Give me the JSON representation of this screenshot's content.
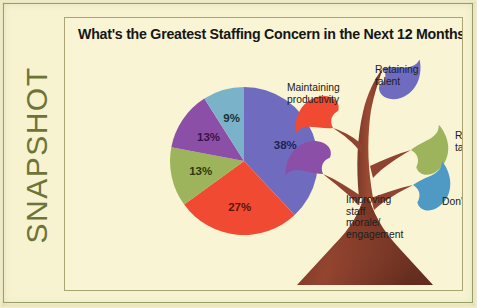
{
  "card": {
    "rail_label": "SNAPSHOT",
    "rail_color": "#6e7436",
    "background": "#f7f2cf",
    "panel_background": "#f9f4d4",
    "border_color": "#a8a572"
  },
  "panel": {
    "title": "What's the Greatest Staffing Concern in the Next 12 Months?"
  },
  "chart_data": {
    "type": "pie",
    "title": "What's the Greatest Staffing Concern in the Next 12 Months?",
    "xlabel": "",
    "ylabel": "",
    "grid": false,
    "legend_position": "external-tree-diagram",
    "start_angle_deg": 0,
    "direction": "clockwise",
    "categories": [
      "Retaining talent",
      "Maintaining productivity",
      "Recruiting talent",
      "Improving staff morale/engagement",
      "Don't know"
    ],
    "values": [
      38,
      27,
      13,
      13,
      9
    ],
    "data_labels": [
      "38%",
      "27%",
      "13%",
      "13%",
      "9%"
    ],
    "colors": [
      "#6f6cc0",
      "#f04a33",
      "#9db45c",
      "#8b4fa8",
      "#7ab3c9"
    ],
    "label_text_colors": [
      "#221f55",
      "#5e1407",
      "#2f3a12",
      "#3a1348",
      "#17323d"
    ]
  },
  "tree": {
    "trunk_color": "#8f4330",
    "trunk_color_dark": "#6d3323",
    "base_color": "#7e3a28",
    "leaves": [
      {
        "name": "retaining-talent-leaf",
        "color": "#6f6cc0",
        "label": "Retaining\ntalent"
      },
      {
        "name": "maintaining-productivity-leaf",
        "color": "#f04a33",
        "label": "Maintaining\nproductivity"
      },
      {
        "name": "recruiting-talent-leaf",
        "color": "#9db45c",
        "label": "Recruiting\ntalent"
      },
      {
        "name": "improving-morale-leaf",
        "color": "#8b4fa8",
        "label": "Improving\nstaff\nmorale/\nengagement"
      },
      {
        "name": "dont-know-leaf",
        "color": "#4f9ac4",
        "label": "Don't know"
      }
    ]
  }
}
